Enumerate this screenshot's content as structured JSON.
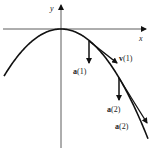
{
  "figure": {
    "axes": {
      "x_label": "x",
      "y_label": "y"
    },
    "curve": {
      "description": "downward-opening parabola with vertex at origin"
    },
    "vectors": [
      {
        "id": "a1",
        "symbol": "a",
        "arg": "(1)",
        "type": "acceleration",
        "at_t": 1
      },
      {
        "id": "v1",
        "symbol": "v",
        "arg": "(1)",
        "type": "velocity",
        "at_t": 1
      },
      {
        "id": "a2",
        "symbol": "a",
        "arg": "(2)",
        "type": "acceleration",
        "at_t": 2
      },
      {
        "id": "a2b",
        "symbol": "a",
        "arg": "(2)",
        "type": "tangent",
        "at_t": 2
      }
    ],
    "colors": {
      "ink": "#111111",
      "background": "#ffffff"
    }
  }
}
